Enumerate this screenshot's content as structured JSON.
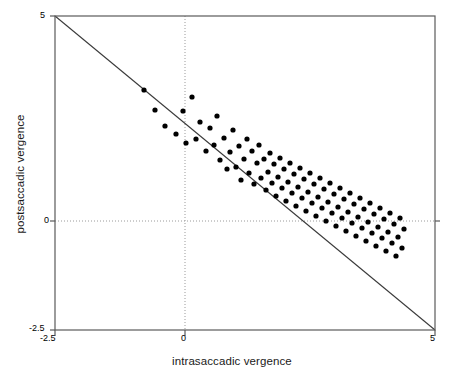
{
  "axes": {
    "xlabel": "intrasaccadic vergence",
    "ylabel": "postsaccadic vergence",
    "x_ticks": [
      "-2.5",
      "0",
      "5"
    ],
    "y_ticks": [
      "5",
      "0",
      "-2.5"
    ],
    "frame_color": "#555555",
    "point_color": "#000000",
    "grid_color": "#999999"
  },
  "chart_data": {
    "type": "scatter",
    "title": "",
    "xlabel": "intrasaccadic vergence",
    "ylabel": "postsaccadic vergence",
    "xlim": [
      -2.5,
      5
    ],
    "ylim": [
      -2.5,
      5
    ],
    "xticks": [
      -2.5,
      0,
      5
    ],
    "yticks": [
      -2.5,
      0,
      5
    ],
    "grid": "dotted gridlines at x=0 and y=0",
    "legend": "none",
    "reference_line": {
      "type": "line",
      "description": "identity line y = -x",
      "slope": -1,
      "intercept": 0,
      "from": [
        -2.5,
        2.5
      ],
      "to": [
        5,
        -5
      ],
      "color": "#333333"
    },
    "points": [
      [
        1.76,
        2.7
      ],
      [
        1.98,
        2.31
      ],
      [
        2.2,
        1.95
      ],
      [
        2.42,
        1.79
      ],
      [
        2.57,
        2.24
      ],
      [
        2.62,
        1.61
      ],
      [
        2.75,
        2.54
      ],
      [
        2.83,
        1.68
      ],
      [
        2.9,
        2.03
      ],
      [
        3.02,
        1.42
      ],
      [
        3.1,
        1.88
      ],
      [
        3.18,
        1.55
      ],
      [
        3.24,
        2.12
      ],
      [
        3.3,
        1.27
      ],
      [
        3.38,
        1.7
      ],
      [
        3.44,
        1.05
      ],
      [
        3.5,
        1.48
      ],
      [
        3.56,
        1.92
      ],
      [
        3.62,
        1.18
      ],
      [
        3.68,
        1.6
      ],
      [
        3.72,
        0.92
      ],
      [
        3.78,
        1.35
      ],
      [
        3.84,
        1.74
      ],
      [
        3.88,
        1.02
      ],
      [
        3.94,
        1.45
      ],
      [
        3.98,
        0.8
      ],
      [
        4.04,
        1.22
      ],
      [
        4.08,
        1.58
      ],
      [
        4.12,
        0.95
      ],
      [
        4.18,
        1.33
      ],
      [
        4.22,
        0.72
      ],
      [
        4.26,
        1.1
      ],
      [
        4.3,
        1.48
      ],
      [
        4.34,
        0.88
      ],
      [
        4.38,
        1.25
      ],
      [
        4.42,
        0.62
      ],
      [
        4.46,
        1.0
      ],
      [
        4.5,
        1.38
      ],
      [
        4.54,
        0.78
      ],
      [
        4.58,
        1.15
      ],
      [
        4.62,
        0.52
      ],
      [
        4.66,
        0.9
      ],
      [
        4.7,
        1.28
      ],
      [
        4.74,
        0.68
      ],
      [
        4.78,
        1.05
      ],
      [
        4.82,
        0.42
      ],
      [
        4.86,
        0.8
      ],
      [
        4.9,
        1.18
      ],
      [
        4.94,
        0.58
      ],
      [
        4.98,
        0.95
      ],
      [
        5.02,
        0.32
      ],
      [
        5.06,
        0.7
      ],
      [
        5.1,
        1.08
      ],
      [
        5.14,
        0.48
      ],
      [
        5.18,
        0.85
      ],
      [
        5.22,
        0.22
      ],
      [
        5.26,
        0.6
      ],
      [
        5.3,
        0.98
      ],
      [
        5.34,
        0.38
      ],
      [
        5.38,
        0.75
      ],
      [
        5.42,
        0.12
      ],
      [
        5.46,
        0.5
      ],
      [
        5.5,
        0.88
      ],
      [
        5.54,
        0.28
      ],
      [
        5.58,
        0.65
      ],
      [
        5.62,
        0.02
      ],
      [
        5.66,
        0.4
      ],
      [
        5.7,
        0.78
      ],
      [
        5.74,
        0.18
      ],
      [
        5.78,
        0.55
      ],
      [
        5.82,
        -0.08
      ],
      [
        5.86,
        0.3
      ],
      [
        5.9,
        0.68
      ],
      [
        5.94,
        0.08
      ],
      [
        5.98,
        0.45
      ],
      [
        6.02,
        -0.18
      ],
      [
        6.06,
        0.2
      ],
      [
        6.1,
        0.58
      ],
      [
        6.14,
        -0.02
      ],
      [
        6.18,
        0.35
      ],
      [
        6.22,
        -0.28
      ],
      [
        6.26,
        0.1
      ],
      [
        6.3,
        0.48
      ],
      [
        6.34,
        -0.12
      ],
      [
        6.38,
        0.25
      ],
      [
        6.42,
        -0.38
      ],
      [
        6.46,
        0.0
      ],
      [
        6.5,
        0.38
      ],
      [
        6.54,
        -0.22
      ],
      [
        6.58,
        0.15
      ],
      [
        6.62,
        -0.48
      ],
      [
        6.66,
        -0.1
      ],
      [
        6.7,
        0.28
      ],
      [
        6.74,
        -0.32
      ],
      [
        6.78,
        0.05
      ],
      [
        6.82,
        -0.58
      ],
      [
        6.86,
        -0.2
      ],
      [
        6.9,
        0.18
      ],
      [
        6.94,
        -0.42
      ],
      [
        6.98,
        -0.05
      ]
    ],
    "points_px": [
      [
        144,
        90
      ],
      [
        155,
        110
      ],
      [
        165,
        126
      ],
      [
        176,
        134
      ],
      [
        183,
        111
      ],
      [
        186,
        143
      ],
      [
        192,
        97
      ],
      [
        196,
        139
      ],
      [
        200,
        122
      ],
      [
        206,
        151
      ],
      [
        210,
        128
      ],
      [
        214,
        145
      ],
      [
        217,
        116
      ],
      [
        220,
        160
      ],
      [
        224,
        138
      ],
      [
        227,
        169
      ],
      [
        230,
        152
      ],
      [
        233,
        130
      ],
      [
        236,
        167
      ],
      [
        239,
        146
      ],
      [
        241,
        180
      ],
      [
        244,
        159
      ],
      [
        247,
        139
      ],
      [
        249,
        173
      ],
      [
        252,
        151
      ],
      [
        254,
        184
      ],
      [
        257,
        163
      ],
      [
        259,
        145
      ],
      [
        261,
        178
      ],
      [
        264,
        159
      ],
      [
        266,
        190
      ],
      [
        268,
        172
      ],
      [
        270,
        153
      ],
      [
        272,
        183
      ],
      [
        274,
        164
      ],
      [
        276,
        196
      ],
      [
        278,
        177
      ],
      [
        280,
        158
      ],
      [
        282,
        188
      ],
      [
        284,
        169
      ],
      [
        286,
        201
      ],
      [
        288,
        182
      ],
      [
        290,
        163
      ],
      [
        292,
        193
      ],
      [
        294,
        174
      ],
      [
        296,
        206
      ],
      [
        298,
        187
      ],
      [
        300,
        168
      ],
      [
        302,
        198
      ],
      [
        304,
        179
      ],
      [
        306,
        211
      ],
      [
        308,
        192
      ],
      [
        310,
        173
      ],
      [
        312,
        203
      ],
      [
        314,
        184
      ],
      [
        316,
        216
      ],
      [
        318,
        197
      ],
      [
        320,
        178
      ],
      [
        322,
        208
      ],
      [
        324,
        189
      ],
      [
        326,
        221
      ],
      [
        328,
        202
      ],
      [
        330,
        183
      ],
      [
        332,
        213
      ],
      [
        334,
        194
      ],
      [
        336,
        226
      ],
      [
        338,
        207
      ],
      [
        340,
        188
      ],
      [
        342,
        218
      ],
      [
        344,
        199
      ],
      [
        346,
        231
      ],
      [
        348,
        212
      ],
      [
        350,
        193
      ],
      [
        352,
        223
      ],
      [
        354,
        204
      ],
      [
        356,
        236
      ],
      [
        358,
        217
      ],
      [
        360,
        198
      ],
      [
        362,
        228
      ],
      [
        364,
        209
      ],
      [
        366,
        241
      ],
      [
        368,
        222
      ],
      [
        370,
        203
      ],
      [
        372,
        233
      ],
      [
        374,
        214
      ],
      [
        376,
        246
      ],
      [
        378,
        227
      ],
      [
        380,
        208
      ],
      [
        382,
        238
      ],
      [
        384,
        219
      ],
      [
        386,
        251
      ],
      [
        388,
        232
      ],
      [
        390,
        213
      ],
      [
        392,
        243
      ],
      [
        394,
        224
      ],
      [
        396,
        256
      ],
      [
        398,
        237
      ],
      [
        400,
        218
      ],
      [
        402,
        248
      ],
      [
        404,
        229
      ]
    ]
  }
}
